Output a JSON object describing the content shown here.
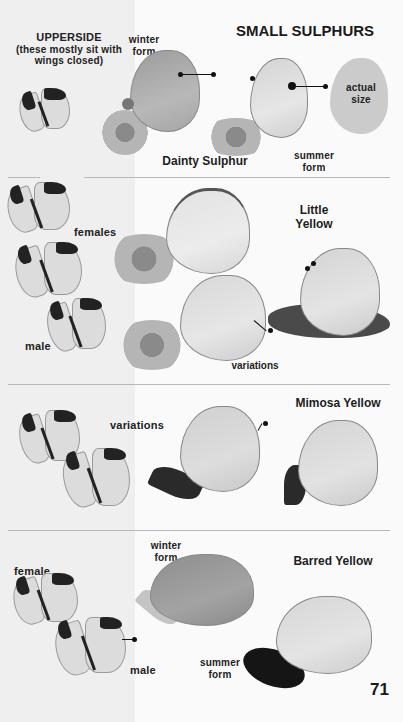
{
  "page": {
    "title": "SMALL SULPHURS",
    "page_number": "71",
    "colors": {
      "background": "#fafafa",
      "left_column": "#efefef",
      "divider": "#b8b8b8",
      "text": "#1a1a1a"
    }
  },
  "sections": [
    {
      "species": "Dainty Sulphur",
      "upperside_label": "UPPERSIDE",
      "upperside_note": "(these mostly sit with wings closed)",
      "labels": {
        "winter": "winter form",
        "summer": "summer form",
        "actual_size": "actual size"
      }
    },
    {
      "species": "Little Yellow",
      "labels": {
        "females": "females",
        "male": "male",
        "variations": "variations"
      }
    },
    {
      "species": "Mimosa Yellow",
      "labels": {
        "variations": "variations"
      }
    },
    {
      "species": "Barred Yellow",
      "labels": {
        "female": "female",
        "male": "male",
        "winter": "winter form",
        "summer": "summer form"
      }
    }
  ]
}
